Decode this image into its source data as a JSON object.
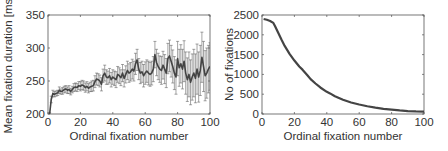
{
  "chart_data": [
    {
      "type": "line",
      "title": "",
      "xlabel": "Ordinal fixation number",
      "ylabel": "Mean fixation duration [ms]",
      "xlim": [
        0,
        100
      ],
      "ylim": [
        200,
        350
      ],
      "xticks": [
        0,
        20,
        40,
        60,
        80,
        100
      ],
      "yticks": [
        200,
        250,
        300,
        350
      ],
      "grid": false,
      "legend": null,
      "error_bars": true,
      "x": [
        1,
        2,
        3,
        4,
        5,
        6,
        7,
        8,
        9,
        10,
        11,
        12,
        13,
        14,
        15,
        16,
        17,
        18,
        19,
        20,
        21,
        22,
        23,
        24,
        25,
        26,
        27,
        28,
        29,
        30,
        31,
        32,
        33,
        34,
        35,
        36,
        37,
        38,
        39,
        40,
        41,
        42,
        43,
        44,
        45,
        46,
        47,
        48,
        49,
        50,
        51,
        52,
        53,
        54,
        55,
        56,
        57,
        58,
        59,
        60,
        61,
        62,
        63,
        64,
        65,
        66,
        67,
        68,
        69,
        70,
        71,
        72,
        73,
        74,
        75,
        76,
        77,
        78,
        79,
        80,
        81,
        82,
        83,
        84,
        85,
        86,
        87,
        88,
        89,
        90,
        91,
        92,
        93,
        94,
        95,
        96,
        97,
        98,
        99,
        100
      ],
      "values": [
        200,
        222,
        231,
        230,
        231,
        232,
        236,
        234,
        235,
        237,
        238,
        236,
        237,
        234,
        237,
        240,
        241,
        240,
        243,
        242,
        244,
        243,
        240,
        242,
        239,
        241,
        242,
        243,
        249,
        253,
        252,
        250,
        245,
        258,
        262,
        256,
        255,
        258,
        252,
        256,
        254,
        252,
        260,
        258,
        255,
        262,
        254,
        260,
        266,
        262,
        264,
        268,
        265,
        276,
        282,
        268,
        262,
        264,
        258,
        262,
        265,
        262,
        260,
        262,
        268,
        290,
        278,
        272,
        268,
        266,
        274,
        268,
        262,
        284,
        288,
        280,
        272,
        262,
        256,
        284,
        270,
        276,
        268,
        280,
        262,
        252,
        260,
        248,
        256,
        262,
        254,
        268,
        256,
        266,
        286,
        272,
        258,
        262,
        268,
        272
      ],
      "errors": [
        2,
        5,
        5,
        4,
        4,
        4,
        5,
        4,
        5,
        5,
        5,
        5,
        6,
        5,
        5,
        6,
        6,
        6,
        6,
        7,
        7,
        7,
        7,
        7,
        7,
        7,
        8,
        8,
        9,
        9,
        9,
        9,
        10,
        10,
        12,
        11,
        10,
        11,
        11,
        11,
        11,
        12,
        12,
        12,
        12,
        13,
        13,
        13,
        14,
        14,
        14,
        15,
        15,
        16,
        16,
        16,
        16,
        16,
        17,
        17,
        17,
        18,
        18,
        18,
        19,
        20,
        20,
        20,
        20,
        21,
        21,
        22,
        22,
        23,
        24,
        24,
        25,
        25,
        26,
        26,
        28,
        29,
        30,
        31,
        32,
        33,
        34,
        34,
        35,
        36,
        37,
        38,
        38,
        38,
        38,
        38,
        38,
        38,
        36,
        36
      ]
    },
    {
      "type": "line",
      "title": "",
      "xlabel": "Ordinal fixation number",
      "ylabel": "No of fixations",
      "xlim": [
        0,
        100
      ],
      "ylim": [
        0,
        2500
      ],
      "xticks": [
        0,
        20,
        40,
        60,
        80,
        100
      ],
      "yticks": [
        0,
        500,
        1000,
        1500,
        2000,
        2500
      ],
      "grid": false,
      "legend": null,
      "x": [
        1,
        3,
        5,
        7,
        8,
        10,
        12,
        14,
        17,
        20,
        23,
        25,
        28,
        30,
        33,
        36,
        40,
        42,
        45,
        50,
        55,
        60,
        65,
        70,
        75,
        80,
        85,
        90,
        95,
        100
      ],
      "values": [
        2400,
        2380,
        2350,
        2300,
        2220,
        2050,
        1880,
        1720,
        1520,
        1350,
        1200,
        1120,
        980,
        880,
        770,
        670,
        560,
        520,
        450,
        360,
        290,
        240,
        195,
        160,
        130,
        110,
        90,
        75,
        65,
        60
      ]
    }
  ]
}
